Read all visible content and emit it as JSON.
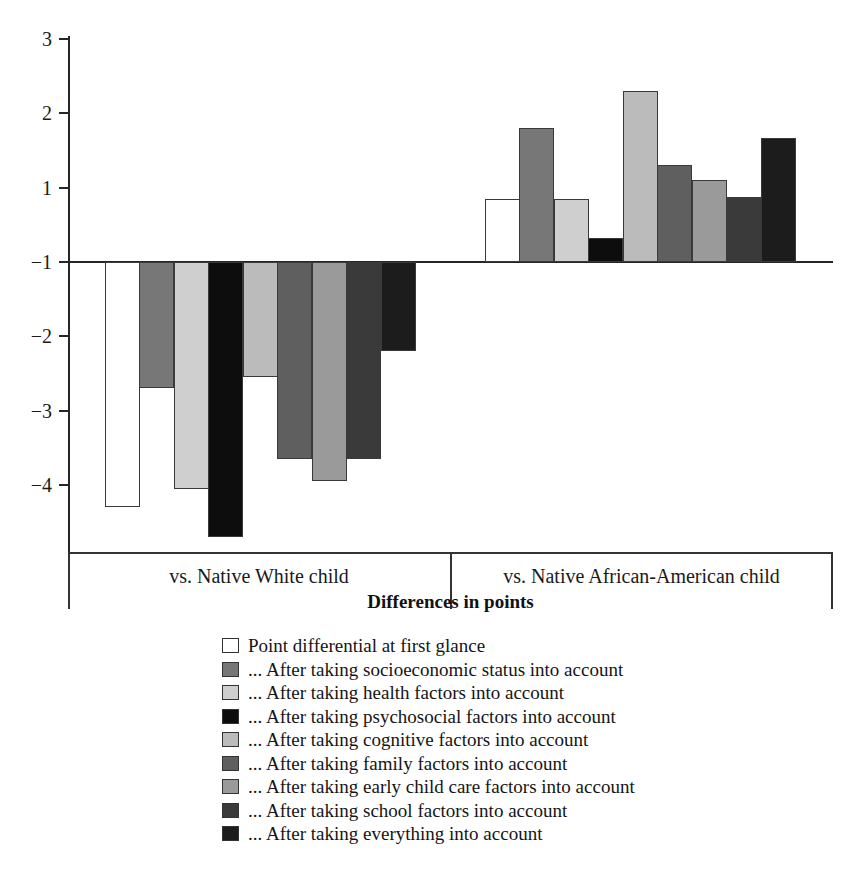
{
  "chart_data": {
    "type": "bar",
    "title": "",
    "xlabel": "Differences in points",
    "ylabel": "",
    "grid": false,
    "legend_position": "bottom",
    "ylim": [
      -4.75,
      3
    ],
    "baseline_value": 0,
    "yticks": [
      3,
      2,
      1,
      -1,
      -2,
      -3,
      -4
    ],
    "ytick_labels": [
      "3",
      "2",
      "1",
      "−1",
      "−2",
      "−3",
      "−4"
    ],
    "categories": [
      "vs. Native White child",
      "vs. Native African-American child"
    ],
    "series": [
      {
        "name": "Point differential at first glance",
        "color": "#ffffff",
        "values": [
          -3.3,
          0.85
        ]
      },
      {
        "name": "... After taking socioeconomic status into account",
        "color": "#777777",
        "values": [
          -1.7,
          1.8
        ]
      },
      {
        "name": "... After taking health factors into account",
        "color": "#cfcfcf",
        "values": [
          -3.05,
          0.85
        ]
      },
      {
        "name": "... After taking psychosocial factors into account",
        "color": "#0d0d0d",
        "values": [
          -3.7,
          0.32
        ]
      },
      {
        "name": "... After taking cognitive factors into account",
        "color": "#bbbbbb",
        "values": [
          -1.55,
          2.3
        ]
      },
      {
        "name": "... After taking family factors into account",
        "color": "#5f5f5f",
        "values": [
          -2.65,
          1.3
        ]
      },
      {
        "name": "... After taking early child care factors into account",
        "color": "#9a9a9a",
        "values": [
          -2.95,
          1.1
        ]
      },
      {
        "name": "... After taking school factors into account",
        "color": "#3a3a3a",
        "values": [
          -2.65,
          0.88
        ]
      },
      {
        "name": "... After taking everything into account",
        "color": "#1c1c1c",
        "values": [
          -1.2,
          1.67
        ]
      }
    ]
  },
  "legend": {
    "items": [
      {
        "label": "Point differential at first glance",
        "color": "#ffffff"
      },
      {
        "label": "... After taking socioeconomic status into account",
        "color": "#777777"
      },
      {
        "label": "... After taking health factors into account",
        "color": "#cfcfcf"
      },
      {
        "label": "... After taking psychosocial factors into account",
        "color": "#0d0d0d"
      },
      {
        "label": "... After taking cognitive factors into account",
        "color": "#bbbbbb"
      },
      {
        "label": "... After taking family factors into account",
        "color": "#5f5f5f"
      },
      {
        "label": "... After taking early child care factors into account",
        "color": "#9a9a9a"
      },
      {
        "label": "... After taking school factors into account",
        "color": "#3a3a3a"
      },
      {
        "label": "... After taking everything into account",
        "color": "#1c1c1c"
      }
    ]
  }
}
